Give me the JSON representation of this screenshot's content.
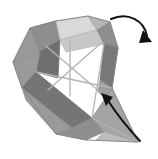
{
  "figure": {
    "canvas": {
      "width": 158,
      "height": 159,
      "background": "#ffffff"
    }
  },
  "palette": {
    "background": "#ffffff",
    "paper_white": "#fdfdfd",
    "light_gray": "#d9d9d9",
    "pale_gray": "#c8c8c8",
    "mid_gray": "#9a9a9a",
    "medium_gray": "#8e8e8e",
    "dark_gray": "#757575",
    "darkest_gray": "#6a6a6a",
    "crease_line": "#b4b4b4",
    "outline": "#8a8a8a",
    "arrow": "#111111"
  },
  "faces": [
    {
      "name": "upper-left-outer-face",
      "fill": "#9a9a9a",
      "points": "13,62 30,28 56,21 40,52"
    },
    {
      "name": "upper-left-inner-face",
      "fill": "#8e8e8e",
      "points": "30,28 56,21 60,40 40,52"
    },
    {
      "name": "left-spine-face",
      "fill": "#6f6f6f",
      "points": "40,52 60,40 58,78 36,72"
    },
    {
      "name": "left-lower-wing-face",
      "fill": "#9a9a9a",
      "points": "13,62 40,52 36,72 22,88"
    },
    {
      "name": "top-center-light-face",
      "fill": "#d9d9d9",
      "points": "56,21 88,16 97,30 60,40"
    },
    {
      "name": "top-center-pale-face",
      "fill": "#c8c8c8",
      "points": "60,40 97,30 104,44 66,52"
    },
    {
      "name": "top-ridge-face",
      "fill": "#b6b6b6",
      "points": "88,16 110,22 97,30"
    },
    {
      "name": "right-upper-face",
      "fill": "#8e8e8e",
      "points": "97,30 110,22 118,48 104,44"
    },
    {
      "name": "right-column-face",
      "fill": "#787878",
      "points": "104,44 118,48 112,88 100,80"
    },
    {
      "name": "right-column-inner-face",
      "fill": "#9e9e9e",
      "points": "100,80 112,88 108,100 98,92"
    },
    {
      "name": "lower-left-dark-band",
      "fill": "#757575",
      "points": "22,88 36,72 92,118 72,128"
    },
    {
      "name": "lower-left-outer-face",
      "fill": "#9a9a9a",
      "points": "22,88 72,128 56,134 26,100"
    },
    {
      "name": "bottom-left-tip-face",
      "fill": "#8e8e8e",
      "points": "56,134 72,128 92,118 104,132 86,140"
    },
    {
      "name": "bottom-right-blade-face",
      "fill": "#a4a4a4",
      "points": "92,118 112,88 138,142 104,132"
    },
    {
      "name": "bottom-center-pale-face",
      "fill": "#bdbdbd",
      "points": "104,132 138,142 96,140"
    }
  ],
  "creases": [
    {
      "name": "crease-x-left",
      "x1": 46,
      "y1": 46,
      "x2": 100,
      "y2": 92
    },
    {
      "name": "crease-x-right",
      "x1": 100,
      "y1": 44,
      "x2": 48,
      "y2": 90
    },
    {
      "name": "crease-center-vertical",
      "x1": 70,
      "y1": 40,
      "x2": 70,
      "y2": 96
    },
    {
      "name": "crease-right-diagonal",
      "x1": 104,
      "y1": 44,
      "x2": 92,
      "y2": 118
    },
    {
      "name": "crease-lower-fold",
      "x1": 36,
      "y1": 72,
      "x2": 112,
      "y2": 88
    },
    {
      "name": "crease-bottom-spine",
      "x1": 92,
      "y1": 118,
      "x2": 138,
      "y2": 142
    }
  ],
  "outlines": [
    {
      "name": "outline-body",
      "points": "13,62 30,28 56,21 88,16 110,22 118,48 112,88 138,142 86,140 56,134 22,88"
    }
  ],
  "arrows": [
    {
      "name": "fold-arrow-top-right",
      "label": "top right fold motion",
      "path": "M 111,19 C 128,12 144,20 147,36",
      "head": "143,30 152,42 139,43",
      "direction": "down-right"
    },
    {
      "name": "fold-arrow-bottom",
      "label": "bottom fold motion",
      "path": "M 140,141 C 126,126 114,110 107,99",
      "head": "101,93 113,97 106,106",
      "direction": "up-left"
    }
  ]
}
